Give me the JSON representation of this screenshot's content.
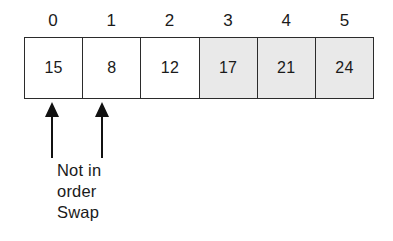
{
  "figure": {
    "colors": {
      "ink": "#1a1a1a",
      "border": "#2b2b2b",
      "shaded_cell": "#e9e9e9",
      "unshaded_cell": "#ffffff",
      "arrow": "#111111",
      "background": "#ffffff"
    }
  },
  "chart_data": {
    "type": "table",
    "title": "",
    "xlabel": "",
    "ylabel": "",
    "categories": [
      "0",
      "1",
      "2",
      "3",
      "4",
      "5"
    ],
    "values": [
      15,
      8,
      12,
      17,
      21,
      24
    ],
    "shaded": [
      false,
      false,
      false,
      true,
      true,
      true
    ]
  },
  "array": {
    "index_labels": [
      "0",
      "1",
      "2",
      "3",
      "4",
      "5"
    ],
    "cells": [
      {
        "index": "0",
        "value": "15",
        "shaded": false
      },
      {
        "index": "1",
        "value": "8",
        "shaded": false
      },
      {
        "index": "2",
        "value": "12",
        "shaded": false
      },
      {
        "index": "3",
        "value": "17",
        "shaded": true
      },
      {
        "index": "4",
        "value": "21",
        "shaded": true
      },
      {
        "index": "5",
        "value": "24",
        "shaded": true
      }
    ]
  },
  "markers": [
    {
      "name": "arrow-index-0",
      "points_to_index": "0",
      "glyph": "up-arrow"
    },
    {
      "name": "arrow-index-1",
      "points_to_index": "1",
      "glyph": "up-arrow"
    }
  ],
  "annotation": {
    "line1": "Not in",
    "line2": "order",
    "line3": "Swap"
  }
}
